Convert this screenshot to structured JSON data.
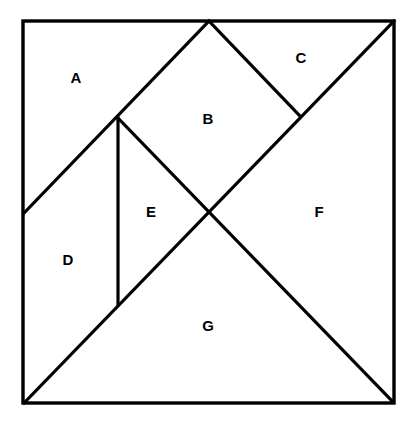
{
  "diagram": {
    "type": "tangram-square",
    "frame": {
      "x1": 23,
      "y1": 21,
      "x2": 394,
      "y2": 403
    },
    "vertices": {
      "TL": [
        23,
        21
      ],
      "TM": [
        209,
        21
      ],
      "TR": [
        394,
        21
      ],
      "L_MID": [
        24,
        213
      ],
      "P_E_TOP": [
        118,
        118
      ],
      "P_C_BOT": [
        299,
        115
      ],
      "CENTER": [
        209,
        211
      ],
      "P_E_BOT": [
        118,
        305
      ],
      "BL": [
        24,
        403
      ],
      "BR": [
        393,
        402
      ]
    },
    "segments": [
      {
        "id": "A-lower-edge",
        "from": "L_MID",
        "to": "TM"
      },
      {
        "id": "B-C-edge",
        "from": "TM",
        "to": "P_C_BOT"
      },
      {
        "id": "main-diagonal",
        "from": "BL",
        "to": "TR"
      },
      {
        "id": "E-left-edge",
        "from": "P_E_TOP",
        "to": "P_E_BOT"
      },
      {
        "id": "anti-diagonal",
        "from": "P_E_TOP",
        "to": "BR"
      }
    ],
    "pieces": [
      {
        "id": "A",
        "label": "A",
        "x": 76,
        "y": 77
      },
      {
        "id": "B",
        "label": "B",
        "x": 208,
        "y": 118
      },
      {
        "id": "C",
        "label": "C",
        "x": 301,
        "y": 57
      },
      {
        "id": "D",
        "label": "D",
        "x": 68,
        "y": 259
      },
      {
        "id": "E",
        "label": "E",
        "x": 151,
        "y": 211
      },
      {
        "id": "F",
        "label": "F",
        "x": 319,
        "y": 211
      },
      {
        "id": "G",
        "label": "G",
        "x": 208,
        "y": 325
      }
    ],
    "colors": {
      "stroke": "#000000",
      "background": "#ffffff",
      "label": "#000000"
    }
  }
}
